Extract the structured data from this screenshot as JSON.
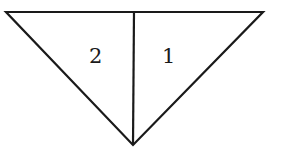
{
  "diagram": {
    "stroke_color": "#1a1a1a",
    "background": "#ffffff",
    "vertices": {
      "top_left": [
        6,
        12
      ],
      "top_right": [
        263,
        12
      ],
      "top_middle": [
        134,
        11
      ],
      "bottom": [
        133,
        145
      ]
    },
    "regions": [
      {
        "label": "2",
        "position": "left"
      },
      {
        "label": "1",
        "position": "right"
      }
    ]
  }
}
